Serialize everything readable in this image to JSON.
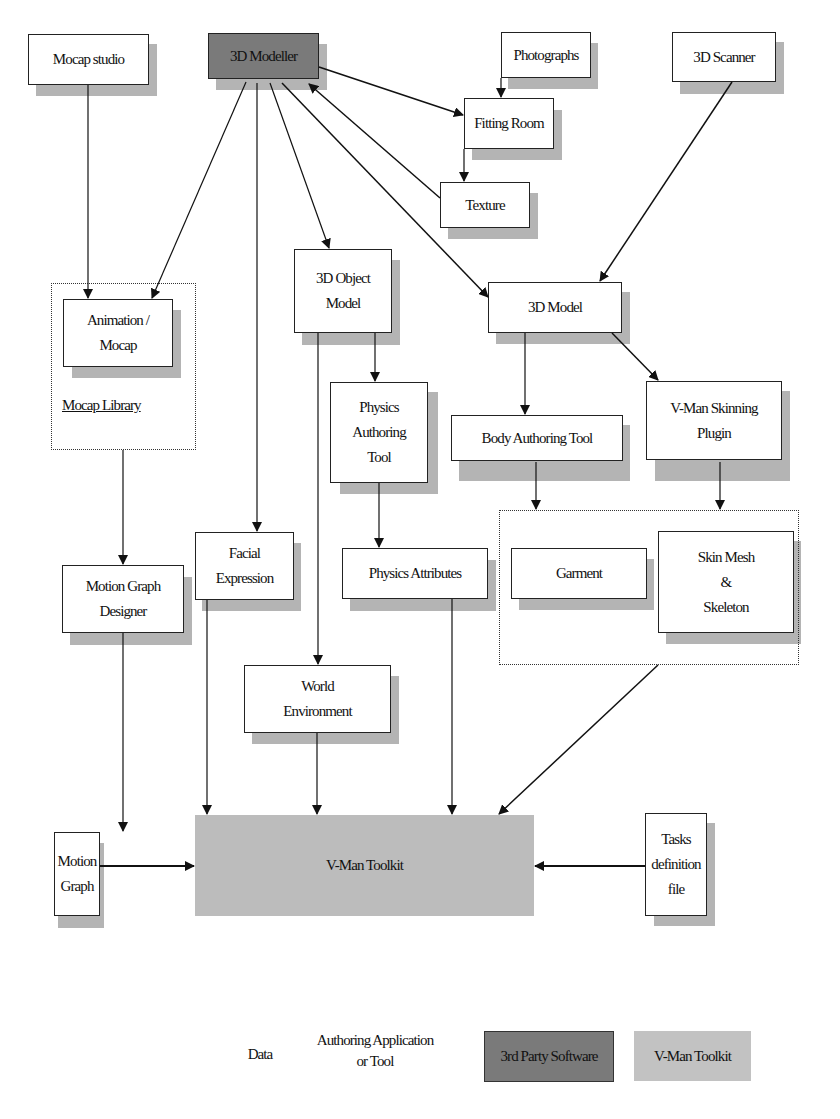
{
  "diagram": {
    "nodes": {
      "mocap_studio": "Mocap studio",
      "modeller_3d": "3D Modeller",
      "photographs": "Photographs",
      "scanner_3d": "3D Scanner",
      "fitting_room": "Fitting Room",
      "texture": "Texture",
      "object_model_3d": "3D Object\nModel",
      "model_3d": "3D Model",
      "animation_mocap": "Animation /\nMocap",
      "physics_authoring_tool": "Physics\nAuthoring\nTool",
      "body_authoring_tool": "Body Authoring Tool",
      "skinning_plugin": "V-Man Skinning\nPlugin",
      "facial_expression": "Facial\nExpression",
      "physics_attributes": "Physics Attributes",
      "motion_graph_designer": "Motion Graph\nDesigner",
      "garment": "Garment",
      "skin_mesh_skeleton": "Skin Mesh\n&\nSkeleton",
      "world_environment": "World\nEnvironment",
      "motion_graph": "Motion\nGraph",
      "vman_toolkit": "V-Man Toolkit",
      "tasks_definition_file": "Tasks\ndefinition\nfile"
    },
    "groups": {
      "mocap_library": "Mocap Library"
    },
    "edges": [
      {
        "from": "Mocap studio",
        "to": "Animation / Mocap"
      },
      {
        "from": "3D Modeller",
        "to": "Animation / Mocap"
      },
      {
        "from": "3D Modeller",
        "to": "Facial Expression"
      },
      {
        "from": "3D Modeller",
        "to": "3D Object Model"
      },
      {
        "from": "3D Modeller",
        "to": "3D Model"
      },
      {
        "from": "3D Modeller",
        "to": "Fitting Room"
      },
      {
        "from": "Texture",
        "to": "3D Modeller"
      },
      {
        "from": "Photographs",
        "to": "Fitting Room"
      },
      {
        "from": "Fitting Room",
        "to": "Texture"
      },
      {
        "from": "3D Scanner",
        "to": "3D Model"
      },
      {
        "from": "3D Model",
        "to": "Body Authoring Tool"
      },
      {
        "from": "3D Model",
        "to": "V-Man Skinning Plugin"
      },
      {
        "from": "Body Authoring Tool",
        "to": "Garment / Skin Mesh group"
      },
      {
        "from": "V-Man Skinning Plugin",
        "to": "Garment / Skin Mesh group"
      },
      {
        "from": "3D Object Model",
        "to": "Physics Authoring Tool"
      },
      {
        "from": "3D Object Model",
        "to": "World Environment"
      },
      {
        "from": "Physics Authoring Tool",
        "to": "Physics Attributes"
      },
      {
        "from": "Mocap Library",
        "to": "Motion Graph Designer"
      },
      {
        "from": "Motion Graph Designer",
        "to": "Motion Graph"
      },
      {
        "from": "Motion Graph",
        "to": "V-Man Toolkit"
      },
      {
        "from": "Facial Expression",
        "to": "V-Man Toolkit"
      },
      {
        "from": "World Environment",
        "to": "V-Man Toolkit"
      },
      {
        "from": "Physics Attributes",
        "to": "V-Man Toolkit"
      },
      {
        "from": "Garment / Skin Mesh group",
        "to": "V-Man Toolkit"
      },
      {
        "from": "Tasks definition file",
        "to": "V-Man Toolkit"
      }
    ]
  },
  "legend": {
    "data": "Data",
    "authoring": "Authoring Application\nor Tool",
    "third_party": "3rd Party Software",
    "toolkit": "V-Man Toolkit"
  },
  "colors": {
    "third_party_fill": "#7a7a7a",
    "toolkit_fill": "#bcbcbc",
    "shadow": "#b4b4b4",
    "stroke": "#222222"
  }
}
